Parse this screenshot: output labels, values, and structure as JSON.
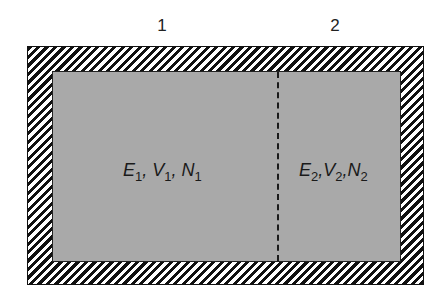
{
  "diagram": {
    "type": "two-subsystem isolated container",
    "region_labels": [
      "1",
      "2"
    ],
    "subsystems": [
      {
        "id": "1",
        "vars": [
          {
            "sym": "E",
            "sub": "1"
          },
          {
            "sym": "V",
            "sub": "1"
          },
          {
            "sym": "N",
            "sub": "1"
          }
        ]
      },
      {
        "id": "2",
        "vars": [
          {
            "sym": "E",
            "sub": "2"
          },
          {
            "sym": "V",
            "sub": "2"
          },
          {
            "sym": "N",
            "sub": "2"
          }
        ]
      }
    ],
    "separator": ",",
    "wall_style": "hatched adiabatic wall",
    "partition_style": "dashed internal partition",
    "colors": {
      "fill": "#a9a9a9",
      "hatch": "#111111",
      "background": "#ffffff"
    }
  }
}
